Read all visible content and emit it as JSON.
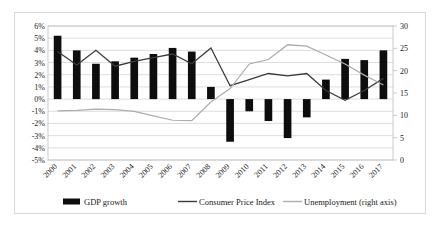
{
  "chart_data": {
    "type": "bar",
    "title": "",
    "xlabel": "",
    "ylabel": "",
    "y2label": "",
    "grid": true,
    "legend_position": "bottom",
    "categories": [
      "2000",
      "2001",
      "2002",
      "2003",
      "2004",
      "2005",
      "2006",
      "2007",
      "2008",
      "2009",
      "2010",
      "2011",
      "2012",
      "2013",
      "2014",
      "2015",
      "2016",
      "2017"
    ],
    "ylim": [
      -5,
      6
    ],
    "ytick_labels": [
      "6%",
      "5%",
      "4%",
      "3%",
      "2%",
      "1%",
      "0%",
      "-1%",
      "-2%",
      "-3%",
      "-4%",
      "-5%"
    ],
    "ytick_values": [
      6,
      5,
      4,
      3,
      2,
      1,
      0,
      -1,
      -2,
      -3,
      -4,
      -5
    ],
    "y2lim": [
      0,
      30
    ],
    "y2tick_labels": [
      "30",
      "25",
      "20",
      "15",
      "10",
      "5",
      "0"
    ],
    "y2tick_values": [
      30,
      25,
      20,
      15,
      10,
      5,
      0
    ],
    "series": [
      {
        "name": "GDP growth",
        "kind": "bar",
        "axis": "left",
        "color": "#0d0d0d",
        "values": [
          5.2,
          4.0,
          2.9,
          3.1,
          3.4,
          3.7,
          4.2,
          3.9,
          1.0,
          -3.5,
          -1.0,
          -1.8,
          -3.2,
          -1.5,
          1.6,
          3.3,
          3.2,
          4.0
        ]
      },
      {
        "name": "Consumer Price Index",
        "kind": "line",
        "axis": "left",
        "color": "#3a3a3a",
        "values": [
          3.9,
          2.8,
          4.0,
          2.7,
          3.1,
          3.4,
          3.7,
          2.9,
          4.2,
          1.1,
          1.6,
          2.1,
          1.9,
          2.1,
          0.7,
          -0.1,
          0.7,
          1.7
        ]
      },
      {
        "name": "Unemployment (right axis)",
        "kind": "line",
        "axis": "right",
        "color": "#adadad",
        "values": [
          11.0,
          11.1,
          11.4,
          11.3,
          10.9,
          9.9,
          8.9,
          8.8,
          13.0,
          16.0,
          21.5,
          22.5,
          25.8,
          25.5,
          23.5,
          21.5,
          19.0,
          16.8
        ]
      }
    ],
    "legend": [
      {
        "label": "GDP growth",
        "marker": "bar",
        "color": "#0d0d0d"
      },
      {
        "label": "Consumer Price Index",
        "marker": "line",
        "color": "#3a3a3a"
      },
      {
        "label": "Unemployment (right axis)",
        "marker": "line",
        "color": "#adadad"
      }
    ]
  }
}
